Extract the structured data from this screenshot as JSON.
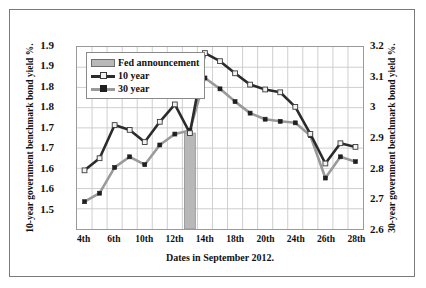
{
  "chart_data": {
    "type": "line",
    "title": "",
    "xlabel": "Dates in September 2012.",
    "ylabel": "10-year government benchmark bond yield %.",
    "ylabel_right": "30-year government benchmark bond yield %.",
    "grid": true,
    "legend_position": "top-left",
    "ylim": [
      1.5,
      1.95
    ],
    "ylim_right": [
      2.6,
      3.2
    ],
    "yticks": [
      1.95,
      1.9,
      1.85,
      1.8,
      1.75,
      1.7,
      1.65,
      1.6,
      1.55
    ],
    "ytick_labels": [
      "1.9",
      "1.9",
      "1.8",
      "1.8",
      "1.7",
      "1.7",
      "1.6",
      "1.6",
      "1.5"
    ],
    "yticks_right": [
      3.2,
      3.1,
      3.0,
      2.9,
      2.8,
      2.7,
      2.6
    ],
    "ytick_labels_right": [
      "3.2",
      "3.1",
      "3",
      "2.9",
      "2.8",
      "2.7",
      "2.6"
    ],
    "x": [
      "4th",
      "5th",
      "6th",
      "7th",
      "10th",
      "11th",
      "12th",
      "13th",
      "14th",
      "17th",
      "18th",
      "19th",
      "20th",
      "21st",
      "24th",
      "25th",
      "26th",
      "27th",
      "28th"
    ],
    "xtick_labels": [
      "4th",
      "6th",
      "10th",
      "12th",
      "14th",
      "18th",
      "20th",
      "24th",
      "26th",
      "28th"
    ],
    "xtick_values": [
      "4th",
      "6th",
      "10th",
      "12th",
      "14th",
      "18th",
      "20th",
      "24th",
      "26th",
      "28th"
    ],
    "series": [
      {
        "name": "10 year",
        "axis": "left",
        "color": "#2b2b2b",
        "marker": "open-square",
        "values": [
          1.645,
          1.675,
          1.757,
          1.745,
          1.715,
          1.765,
          1.808,
          1.737,
          1.935,
          1.915,
          1.885,
          1.857,
          1.845,
          1.838,
          1.802,
          1.735,
          1.662,
          1.712,
          1.703
        ]
      },
      {
        "name": "30 year",
        "axis": "right",
        "color": "#9a9a9a",
        "marker": "filled-square",
        "values": [
          2.69,
          2.718,
          2.803,
          2.838,
          2.812,
          2.877,
          2.913,
          2.925,
          3.098,
          3.062,
          3.02,
          2.982,
          2.962,
          2.955,
          2.95,
          2.908,
          2.768,
          2.838,
          2.822
        ]
      }
    ],
    "annotations": [
      {
        "name": "Fed announcement",
        "type": "bar",
        "x": "13th",
        "value": 1.737,
        "color": "#b8b8b8"
      }
    ],
    "legend": [
      {
        "label": "Fed announcement",
        "swatch": "bar"
      },
      {
        "label": "10 year",
        "swatch": "line-dark-open-square"
      },
      {
        "label": "30 year",
        "swatch": "line-gray-filled-square"
      }
    ]
  }
}
